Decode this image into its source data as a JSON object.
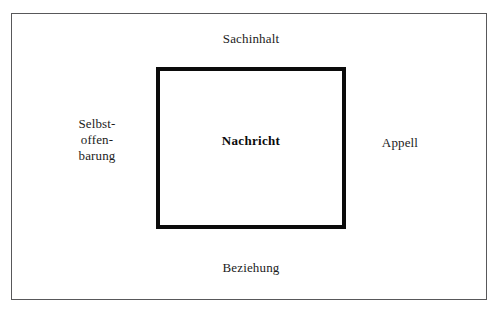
{
  "diagram": {
    "type": "nested-rectangle-communication-model",
    "background_color": "#ffffff",
    "outer_frame": {
      "name": "outer-frame",
      "border_color": "#58585a",
      "border_width_px": 1
    },
    "inner_frame": {
      "name": "inner-frame",
      "border_color": "#0b0b0b",
      "border_width_px": 4
    },
    "labels": {
      "top": "Sachinhalt",
      "bottom": "Beziehung",
      "left_line1": "Selbst-",
      "left_line2": "offen-",
      "left_line3": "barung",
      "right": "Appell",
      "center": "Nachricht"
    }
  }
}
